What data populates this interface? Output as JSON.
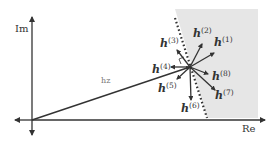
{
  "axes": {
    "x_label": "Re",
    "y_label": "Im"
  },
  "main_vector": {
    "label": "hz",
    "from": [
      32,
      120
    ],
    "to": [
      190,
      67
    ]
  },
  "colors": {
    "shade": "#e6e6e6",
    "ink": "#333333",
    "background": "#ffffff"
  },
  "center": [
    190,
    67
  ],
  "vectors": [
    {
      "id": "h1",
      "base": "h",
      "sup": "(1)",
      "tip": [
        214,
        53
      ],
      "label_pos": [
        214,
        46
      ]
    },
    {
      "id": "h2",
      "base": "h",
      "sup": "(2)",
      "tip": [
        202,
        44
      ],
      "label_pos": [
        193,
        37
      ]
    },
    {
      "id": "h3",
      "base": "h",
      "sup": "(3)",
      "tip": [
        177,
        50
      ],
      "label_pos": [
        160,
        47
      ]
    },
    {
      "id": "h4",
      "base": "h",
      "sup": "(4)",
      "tip": [
        171,
        67
      ],
      "label_pos": [
        152,
        73
      ]
    },
    {
      "id": "h5",
      "base": "h",
      "sup": "(5)",
      "tip": [
        177,
        79
      ],
      "label_pos": [
        158,
        92
      ]
    },
    {
      "id": "h6",
      "base": "h",
      "sup": "(6)",
      "tip": [
        191,
        100
      ],
      "label_pos": [
        181,
        112
      ]
    },
    {
      "id": "h7",
      "base": "h",
      "sup": "(7)",
      "tip": [
        215,
        90
      ],
      "label_pos": [
        215,
        99
      ]
    },
    {
      "id": "h8",
      "base": "h",
      "sup": "(8)",
      "tip": [
        208,
        74
      ],
      "label_pos": [
        212,
        80
      ]
    }
  ]
}
